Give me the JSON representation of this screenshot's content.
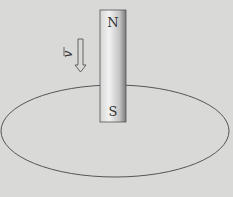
{
  "diagram": {
    "background": "#d9d9d7",
    "magnet": {
      "top_pole_label": "N",
      "bottom_pole_label": "S",
      "x": 100,
      "y": 10,
      "width": 26,
      "height": 112
    },
    "velocity": {
      "label": "v",
      "direction": "down",
      "vector_marker": "arrow-over"
    },
    "loop": {
      "shape": "ellipse",
      "cx": 115,
      "cy": 131,
      "rx": 114,
      "ry": 46,
      "stroke": "#555555"
    }
  }
}
